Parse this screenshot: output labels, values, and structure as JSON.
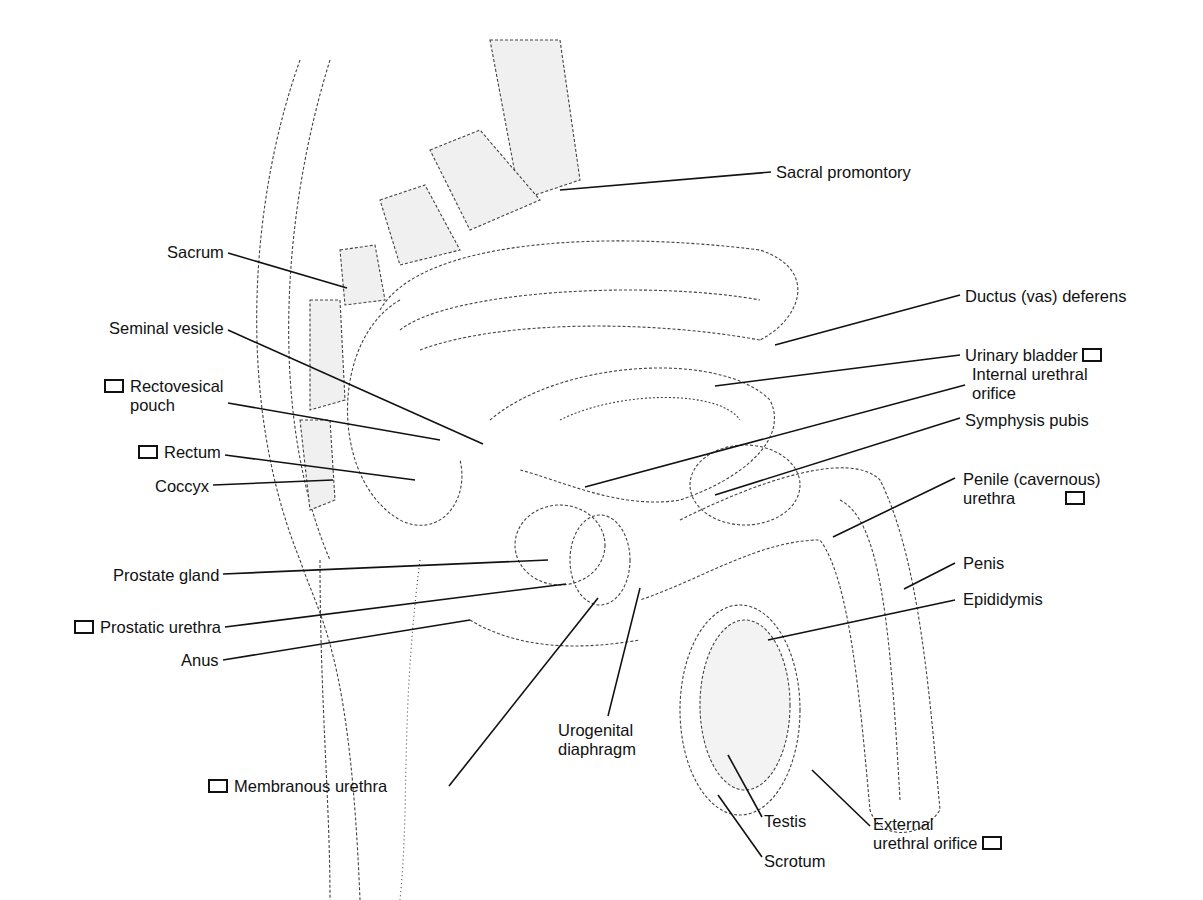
{
  "diagram": {
    "labels": [
      {
        "id": "sacral-promontory",
        "text": "Sacral promontory",
        "checkbox": false,
        "x": 776,
        "y": 163,
        "line": [
          771,
          172,
          560,
          190
        ]
      },
      {
        "id": "sacrum",
        "text": "Sacrum",
        "checkbox": false,
        "x": 147,
        "y": 243,
        "line": [
          228,
          253,
          347,
          288
        ]
      },
      {
        "id": "ductus-deferens",
        "text": "Ductus (vas) deferens",
        "checkbox": false,
        "x": 965,
        "y": 287,
        "line": [
          960,
          295,
          775,
          345
        ]
      },
      {
        "id": "seminal-vesicle",
        "text": "Seminal vesicle",
        "checkbox": false,
        "x": 75,
        "y": 319,
        "line": [
          228,
          330,
          483,
          444
        ]
      },
      {
        "id": "urinary-bladder",
        "text": "Urinary bladder",
        "checkbox": true,
        "x": 965,
        "y": 346,
        "line": [
          960,
          355,
          715,
          386
        ]
      },
      {
        "id": "internal-urethral-orifice",
        "text": "Internal urethral\norifice",
        "checkbox": false,
        "x": 972,
        "y": 365,
        "line": [
          965,
          385,
          585,
          487
        ]
      },
      {
        "id": "rectovesical-pouch",
        "text": "Rectovesical\npouch",
        "checkbox": true,
        "x": 70,
        "y": 377,
        "line": [
          228,
          403,
          440,
          440
        ]
      },
      {
        "id": "symphysis-pubis",
        "text": "Symphysis pubis",
        "checkbox": false,
        "x": 965,
        "y": 411,
        "line": [
          960,
          418,
          715,
          495
        ]
      },
      {
        "id": "rectum",
        "text": "Rectum",
        "checkbox": true,
        "x": 112,
        "y": 443,
        "line": [
          225,
          455,
          415,
          480
        ]
      },
      {
        "id": "coccyx",
        "text": "Coccyx",
        "checkbox": false,
        "x": 145,
        "y": 477,
        "line": [
          213,
          485,
          333,
          480
        ]
      },
      {
        "id": "penile-urethra",
        "text": "Penile (cavernous)\nurethra",
        "checkbox": true,
        "x": 963,
        "y": 470,
        "line": [
          955,
          478,
          833,
          537
        ]
      },
      {
        "id": "prostate-gland",
        "text": "Prostate gland",
        "checkbox": false,
        "x": 83,
        "y": 566,
        "line": [
          223,
          574,
          548,
          560
        ]
      },
      {
        "id": "penis",
        "text": "Penis",
        "checkbox": false,
        "x": 963,
        "y": 554,
        "line": [
          955,
          563,
          904,
          589
        ]
      },
      {
        "id": "prostatic-urethra",
        "text": "Prostatic urethra",
        "checkbox": true,
        "x": 32,
        "y": 618,
        "line": [
          225,
          627,
          566,
          584
        ]
      },
      {
        "id": "epididymis",
        "text": "Epididymis",
        "checkbox": false,
        "x": 963,
        "y": 590,
        "line": [
          955,
          600,
          768,
          640
        ]
      },
      {
        "id": "anus",
        "text": "Anus",
        "checkbox": false,
        "x": 175,
        "y": 651,
        "line": [
          223,
          660,
          470,
          620
        ]
      },
      {
        "id": "urogenital-diaphragm",
        "text": "Urogenital\ndiaphragm",
        "checkbox": false,
        "x": 558,
        "y": 721,
        "line": [
          608,
          716,
          640,
          588
        ]
      },
      {
        "id": "membranous-urethra",
        "text": "Membranous urethra",
        "checkbox": true,
        "x": 208,
        "y": 777,
        "line": [
          449,
          786,
          598,
          598
        ]
      },
      {
        "id": "testis",
        "text": "Testis",
        "checkbox": false,
        "x": 764,
        "y": 812,
        "line": [
          762,
          817,
          728,
          755
        ]
      },
      {
        "id": "external-urethral-orifice",
        "text": "External\nurethral orifice",
        "checkbox": true,
        "x": 873,
        "y": 815,
        "line": [
          870,
          826,
          812,
          770
        ]
      },
      {
        "id": "scrotum",
        "text": "Scrotum",
        "checkbox": false,
        "x": 764,
        "y": 852,
        "line": [
          762,
          857,
          718,
          795
        ]
      }
    ]
  }
}
